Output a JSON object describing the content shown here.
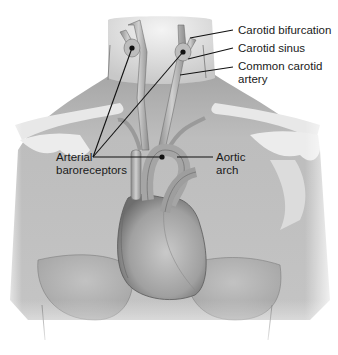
{
  "diagram": {
    "labels": {
      "carotid_bifurcation": "Carotid bifurcation",
      "carotid_sinus": "Carotid sinus",
      "common_carotid_line1": "Common carotid",
      "common_carotid_line2": "artery",
      "arterial_line1": "Arterial",
      "arterial_line2": "baroreceptors",
      "aortic_line1": "Aortic",
      "aortic_line2": "arch"
    },
    "colors": {
      "background": "#ffffff",
      "skin": "#bdbdbd",
      "skin_dark": "#8a8a8a",
      "bone": "#e6e6e6",
      "vessel": "#a8a8a8",
      "heart": "#9c9c9c",
      "leader_line": "#111111"
    }
  }
}
